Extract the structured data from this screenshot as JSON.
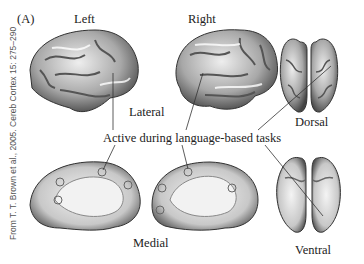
{
  "figure": {
    "panel_label": "(A)",
    "labels": {
      "left": "Left",
      "right": "Right",
      "lateral": "Lateral",
      "dorsal": "Dorsal",
      "medial": "Medial",
      "ventral": "Ventral",
      "callout": "Active during language-based tasks"
    },
    "credit": "From T. T. Brown et al., 2005. Cereb Cortex 15: 275–290",
    "views": [
      {
        "name": "left-lateral"
      },
      {
        "name": "right-lateral"
      },
      {
        "name": "dorsal"
      },
      {
        "name": "left-medial"
      },
      {
        "name": "right-medial"
      },
      {
        "name": "ventral"
      }
    ]
  }
}
